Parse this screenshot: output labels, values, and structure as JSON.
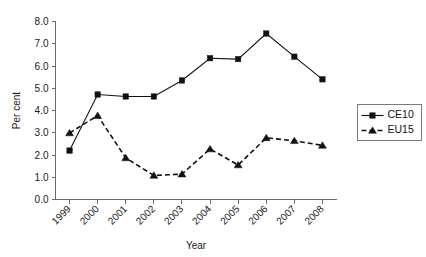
{
  "chart_data": {
    "type": "line",
    "title": "",
    "xlabel": "Year",
    "ylabel": "Per cent",
    "categories": [
      "1999",
      "2000",
      "2001",
      "2002",
      "2003",
      "2004",
      "2005",
      "2006",
      "2007",
      "2008"
    ],
    "ylim": [
      0.0,
      8.0
    ],
    "ytick_labels": [
      "0.0",
      "1.0",
      "2.0",
      "3.0",
      "4.0",
      "5.0",
      "6.0",
      "7.0",
      "8.0"
    ],
    "ytick_values": [
      0.0,
      1.0,
      2.0,
      3.0,
      4.0,
      5.0,
      6.0,
      7.0,
      8.0
    ],
    "grid": false,
    "legend_position": "right",
    "series": [
      {
        "name": "CE10",
        "marker": "square",
        "linestyle": "solid",
        "color": "#111111",
        "values": [
          2.2,
          4.72,
          4.63,
          4.63,
          5.35,
          6.35,
          6.31,
          7.46,
          6.42,
          5.4
        ]
      },
      {
        "name": "EU15",
        "marker": "triangle",
        "linestyle": "dashed",
        "color": "#111111",
        "values": [
          2.99,
          3.77,
          1.87,
          1.08,
          1.14,
          2.27,
          1.55,
          2.77,
          2.64,
          2.43
        ]
      }
    ]
  },
  "legend": {
    "entries": [
      {
        "label": "CE10"
      },
      {
        "label": "EU15"
      }
    ]
  },
  "axes": {
    "x_title": "Year",
    "y_title": "Per cent"
  }
}
